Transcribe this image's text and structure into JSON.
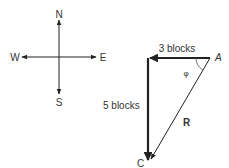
{
  "compass": {
    "north": "N",
    "south": "S",
    "east": "E",
    "west": "W"
  },
  "triangle": {
    "vertex_a": "A",
    "vertex_c": "C",
    "west_leg_label": "3 blocks",
    "south_leg_label": "5 blocks",
    "resultant_label": "R",
    "angle_label": "φ"
  },
  "colors": {
    "ink": "#222222",
    "background": "#ffffff"
  }
}
